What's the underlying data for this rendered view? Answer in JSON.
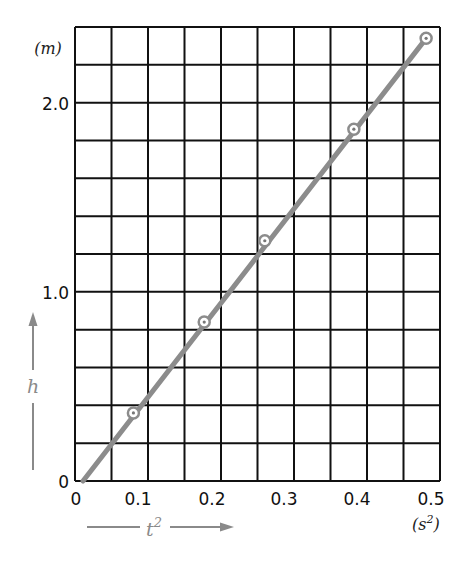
{
  "chart_data": {
    "type": "scatter",
    "title": "",
    "xlabel": "t^2",
    "xunit": "(s²)",
    "ylabel": "h",
    "yunit": "(m)",
    "xlim": [
      0,
      0.5
    ],
    "ylim": [
      0,
      2.4
    ],
    "grid": true,
    "grid_x_step": 0.05,
    "grid_y_step": 0.2,
    "x_ticks": [
      "0",
      "0.1",
      "0.2",
      "0.3",
      "0.4",
      "0.5"
    ],
    "y_ticks": [
      "0",
      "1.0",
      "2.0"
    ],
    "legend": null,
    "series": [
      {
        "name": "measurements",
        "marker": "circle-dot",
        "x": [
          0.08,
          0.177,
          0.26,
          0.382,
          0.481
        ],
        "y": [
          0.36,
          0.84,
          1.27,
          1.86,
          2.34
        ]
      },
      {
        "name": "best-fit line",
        "type": "line",
        "x": [
          0.011,
          0.481
        ],
        "y": [
          0.0,
          2.34
        ]
      }
    ],
    "colors": {
      "grid": "#111111",
      "line": "#8c8c8c",
      "axis_arrows": "#8a8a8a"
    }
  },
  "labels": {
    "y_unit": "(m)",
    "x_unit_base": "(s",
    "x_unit_exp": "2",
    "x_unit_close": ")",
    "x_axis_name": "t",
    "x_axis_exp": "2",
    "y_axis_name": "h",
    "x_ticks": [
      "0",
      "0.1",
      "0.2",
      "0.3",
      "0.4",
      "0.5"
    ],
    "y_ticks": [
      "0",
      "1.0",
      "2.0"
    ]
  }
}
